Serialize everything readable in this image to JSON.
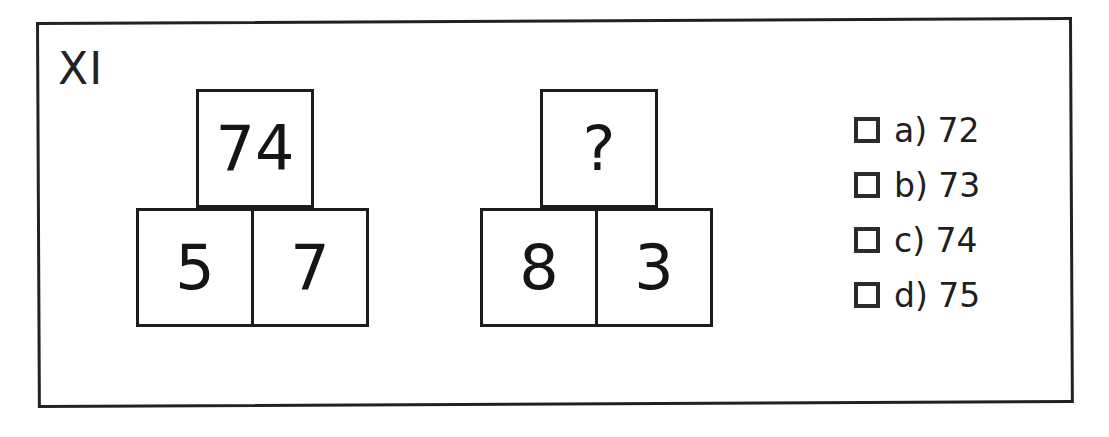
{
  "question": {
    "number": "XI",
    "type": "block-pyramid-arithmetic",
    "border_color": "#222222"
  },
  "pyramids": [
    {
      "name": "example-pyramid",
      "top": {
        "value": "74"
      },
      "bottom": [
        {
          "value": "5"
        },
        {
          "value": "7"
        }
      ]
    },
    {
      "name": "query-pyramid",
      "top": {
        "value": "?"
      },
      "bottom": [
        {
          "value": "8"
        },
        {
          "value": "3"
        }
      ]
    }
  ],
  "answers": {
    "checkbox_icon": "empty-checkbox-icon",
    "options": [
      {
        "key": "a",
        "label": "a) 72",
        "value": "72",
        "checked": false
      },
      {
        "key": "b",
        "label": "b) 73",
        "value": "73",
        "checked": false
      },
      {
        "key": "c",
        "label": "c) 74",
        "value": "74",
        "checked": false
      },
      {
        "key": "d",
        "label": "d) 75",
        "value": "75",
        "checked": false
      }
    ]
  }
}
